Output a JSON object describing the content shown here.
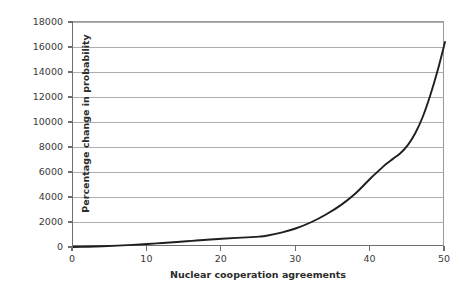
{
  "chart_data": {
    "type": "line",
    "title": "",
    "xlabel": "Nuclear cooperation agreements",
    "ylabel": "Percentage change in probability",
    "xlim": [
      0,
      50
    ],
    "ylim": [
      0,
      18000
    ],
    "grid": "horizontal",
    "legend": "none",
    "x_ticks": [
      0,
      10,
      20,
      30,
      40,
      50
    ],
    "x_tick_labels": [
      "0",
      "10",
      "20",
      "30",
      "40",
      "50"
    ],
    "y_ticks": [
      0,
      2000,
      4000,
      6000,
      8000,
      10000,
      12000,
      14000,
      16000,
      18000
    ],
    "y_tick_labels": [
      "0",
      "2000",
      "4000",
      "6000",
      "8000",
      "10000",
      "12000",
      "14000",
      "16000",
      "18000"
    ],
    "series": [
      {
        "name": "Percentage change in probability",
        "color": "#1f1f1f",
        "x": [
          0,
          2,
          4,
          6,
          8,
          10,
          12,
          14,
          16,
          18,
          20,
          22,
          24,
          25,
          26,
          28,
          30,
          32,
          34,
          36,
          38,
          40,
          41,
          42,
          43,
          44,
          45,
          46,
          47,
          48,
          49,
          50
        ],
        "values": [
          0,
          20,
          60,
          110,
          170,
          240,
          320,
          400,
          490,
          580,
          660,
          730,
          790,
          830,
          900,
          1150,
          1500,
          1980,
          2600,
          3350,
          4300,
          5500,
          6050,
          6600,
          7050,
          7500,
          8150,
          9100,
          10400,
          12100,
          14100,
          16400
        ]
      }
    ]
  },
  "axis_styles": {
    "gridline_color": "#aeaeae",
    "axis_color": "#6e6e6e",
    "plot_border_color": "#9a9a9a",
    "background_color": "#ffffff",
    "text_color": "#2b2b2b"
  }
}
